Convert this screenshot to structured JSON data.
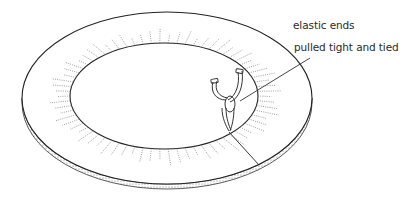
{
  "diagram": {
    "callout": {
      "line1": "elastic ends",
      "line2": "pulled tight and tied"
    },
    "colors": {
      "ink": "#2a2a2a",
      "background": "#ffffff",
      "shade": "#8a8a8a"
    }
  }
}
